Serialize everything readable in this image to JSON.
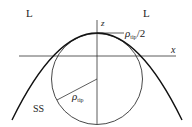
{
  "diagram": {
    "region_labels": {
      "left": "L",
      "right": "L"
    },
    "axes": {
      "z_label": "z",
      "x_label": "x"
    },
    "solid_label": "SS",
    "radius_label": {
      "rho": "ρ",
      "sub": "tip"
    },
    "half_radius_label": {
      "rho": "ρ",
      "sub": "tip",
      "suffix": "/2"
    },
    "colors": {
      "stroke": "#222222",
      "background": "#ffffff"
    }
  }
}
